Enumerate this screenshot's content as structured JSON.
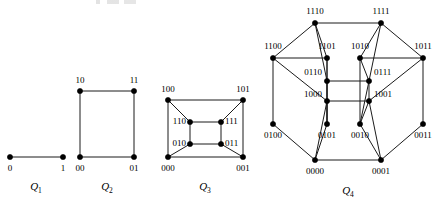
{
  "figure": {
    "background_color": "#ffffff",
    "edge_color": "#1b1b1b",
    "vertex_color": "#000000",
    "text_color": "#000000"
  },
  "graphs": [
    {
      "id": "q1",
      "caption_base": "Q",
      "caption_sub": "1",
      "caption_x": 36,
      "caption_y": 190,
      "dimension": 1,
      "vertex_count": 2,
      "edge_count": 1,
      "vertices": [
        {
          "label": "0",
          "x": 10,
          "y": 157,
          "label_x": 10,
          "label_y": 169,
          "label_anchor": "middle"
        },
        {
          "label": "1",
          "x": 63,
          "y": 157,
          "label_x": 63,
          "label_y": 169,
          "label_anchor": "middle"
        }
      ],
      "edges": [
        [
          0,
          1
        ]
      ]
    },
    {
      "id": "q2",
      "caption_base": "Q",
      "caption_sub": "2",
      "caption_x": 107,
      "caption_y": 190,
      "dimension": 2,
      "vertex_count": 4,
      "edge_count": 4,
      "vertices": [
        {
          "label": "10",
          "x": 80,
          "y": 91,
          "label_x": 80,
          "label_y": 81,
          "label_anchor": "middle"
        },
        {
          "label": "11",
          "x": 134,
          "y": 91,
          "label_x": 134,
          "label_y": 81,
          "label_anchor": "middle"
        },
        {
          "label": "00",
          "x": 80,
          "y": 157,
          "label_x": 80,
          "label_y": 169,
          "label_anchor": "middle"
        },
        {
          "label": "01",
          "x": 134,
          "y": 157,
          "label_x": 134,
          "label_y": 169,
          "label_anchor": "middle"
        }
      ],
      "edges": [
        [
          0,
          1
        ],
        [
          2,
          3
        ],
        [
          0,
          2
        ],
        [
          1,
          3
        ]
      ]
    },
    {
      "id": "q3",
      "caption_base": "Q",
      "caption_sub": "3",
      "caption_x": 205,
      "caption_y": 190,
      "dimension": 3,
      "vertex_count": 8,
      "edge_count": 12,
      "vertices": [
        {
          "label": "100",
          "x": 168,
          "y": 100,
          "label_x": 168,
          "label_y": 90,
          "label_anchor": "middle"
        },
        {
          "label": "101",
          "x": 243,
          "y": 100,
          "label_x": 243,
          "label_y": 90,
          "label_anchor": "middle"
        },
        {
          "label": "000",
          "x": 168,
          "y": 157,
          "label_x": 168,
          "label_y": 169,
          "label_anchor": "middle"
        },
        {
          "label": "001",
          "x": 243,
          "y": 157,
          "label_x": 243,
          "label_y": 169,
          "label_anchor": "middle"
        },
        {
          "label": "110",
          "x": 190,
          "y": 122,
          "label_x": 186,
          "label_y": 122,
          "label_anchor": "end"
        },
        {
          "label": "111",
          "x": 221,
          "y": 122,
          "label_x": 225,
          "label_y": 122,
          "label_anchor": "start"
        },
        {
          "label": "010",
          "x": 190,
          "y": 144,
          "label_x": 186,
          "label_y": 144,
          "label_anchor": "end"
        },
        {
          "label": "011",
          "x": 221,
          "y": 144,
          "label_x": 225,
          "label_y": 144,
          "label_anchor": "start"
        }
      ],
      "edges": [
        [
          0,
          1
        ],
        [
          2,
          3
        ],
        [
          0,
          2
        ],
        [
          1,
          3
        ],
        [
          4,
          5
        ],
        [
          6,
          7
        ],
        [
          4,
          6
        ],
        [
          5,
          7
        ],
        [
          0,
          4
        ],
        [
          1,
          5
        ],
        [
          2,
          6
        ],
        [
          3,
          7
        ]
      ]
    },
    {
      "id": "q4",
      "caption_base": "Q",
      "caption_sub": "4",
      "caption_x": 348,
      "caption_y": 194,
      "dimension": 4,
      "vertex_count": 16,
      "edge_count": 32,
      "vertices": [
        {
          "label": "1110",
          "x": 315,
          "y": 23,
          "label_x": 315,
          "label_y": 12,
          "label_anchor": "middle"
        },
        {
          "label": "1111",
          "x": 381,
          "y": 23,
          "label_x": 381,
          "label_y": 12,
          "label_anchor": "middle"
        },
        {
          "label": "1100",
          "x": 273,
          "y": 58,
          "label_x": 273,
          "label_y": 47,
          "label_anchor": "middle"
        },
        {
          "label": "1011",
          "x": 423,
          "y": 58,
          "label_x": 423,
          "label_y": 47,
          "label_anchor": "middle"
        },
        {
          "label": "1101",
          "x": 327,
          "y": 58,
          "label_x": 327,
          "label_y": 47,
          "label_anchor": "middle"
        },
        {
          "label": "1010",
          "x": 360,
          "y": 58,
          "label_x": 360,
          "label_y": 47,
          "label_anchor": "middle"
        },
        {
          "label": "0110",
          "x": 327,
          "y": 81,
          "label_x": 322,
          "label_y": 73,
          "label_anchor": "end"
        },
        {
          "label": "0111",
          "x": 369,
          "y": 81,
          "label_x": 374,
          "label_y": 73,
          "label_anchor": "start"
        },
        {
          "label": "1000",
          "x": 327,
          "y": 101,
          "label_x": 322,
          "label_y": 95,
          "label_anchor": "end"
        },
        {
          "label": "1001",
          "x": 369,
          "y": 101,
          "label_x": 374,
          "label_y": 95,
          "label_anchor": "start"
        },
        {
          "label": "0100",
          "x": 273,
          "y": 124,
          "label_x": 273,
          "label_y": 136,
          "label_anchor": "middle"
        },
        {
          "label": "0011",
          "x": 423,
          "y": 124,
          "label_x": 423,
          "label_y": 136,
          "label_anchor": "middle"
        },
        {
          "label": "0101",
          "x": 327,
          "y": 124,
          "label_x": 327,
          "label_y": 136,
          "label_anchor": "middle"
        },
        {
          "label": "0010",
          "x": 360,
          "y": 124,
          "label_x": 360,
          "label_y": 136,
          "label_anchor": "middle"
        },
        {
          "label": "0000",
          "x": 315,
          "y": 160,
          "label_x": 315,
          "label_y": 172,
          "label_anchor": "middle"
        },
        {
          "label": "0001",
          "x": 381,
          "y": 160,
          "label_x": 381,
          "label_y": 172,
          "label_anchor": "middle"
        }
      ],
      "edges": [
        [
          0,
          1
        ],
        [
          0,
          2
        ],
        [
          1,
          3
        ],
        [
          2,
          10
        ],
        [
          3,
          11
        ],
        [
          10,
          14
        ],
        [
          11,
          15
        ],
        [
          14,
          15
        ],
        [
          0,
          4
        ],
        [
          1,
          5
        ],
        [
          4,
          12
        ],
        [
          5,
          13
        ],
        [
          12,
          14
        ],
        [
          13,
          15
        ],
        [
          2,
          4
        ],
        [
          3,
          5
        ],
        [
          6,
          7
        ],
        [
          6,
          8
        ],
        [
          7,
          9
        ],
        [
          8,
          9
        ],
        [
          0,
          6
        ],
        [
          1,
          7
        ],
        [
          6,
          12
        ],
        [
          7,
          13
        ],
        [
          2,
          8
        ],
        [
          3,
          9
        ],
        [
          8,
          14
        ],
        [
          9,
          15
        ],
        [
          4,
          6
        ],
        [
          5,
          7
        ],
        [
          8,
          12
        ],
        [
          9,
          13
        ]
      ]
    }
  ]
}
